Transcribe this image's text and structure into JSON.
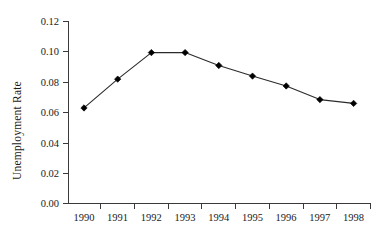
{
  "chart_data": {
    "type": "line",
    "title": "",
    "xlabel": "",
    "ylabel": "Unemployment Rate",
    "categories": [
      "1990",
      "1991",
      "1992",
      "1993",
      "1994",
      "1995",
      "1996",
      "1997",
      "1998"
    ],
    "x": [
      1990,
      1991,
      1992,
      1993,
      1994,
      1995,
      1996,
      1997,
      1998
    ],
    "values": [
      0.063,
      0.082,
      0.0995,
      0.0995,
      0.091,
      0.084,
      0.0775,
      0.0685,
      0.066
    ],
    "series": [
      {
        "name": "Unemployment Rate",
        "values": [
          0.063,
          0.082,
          0.0995,
          0.0995,
          0.091,
          0.084,
          0.0775,
          0.0685,
          0.066
        ]
      }
    ],
    "ylim": [
      0.0,
      0.12
    ],
    "ytick_labels": [
      "0.00",
      "0.02",
      "0.04",
      "0.06",
      "0.08",
      "0.10",
      "0.12"
    ],
    "ytick_values": [
      0.0,
      0.02,
      0.04,
      0.06,
      0.08,
      0.1,
      0.12
    ],
    "xtick_labels": [
      "1990",
      "1991",
      "1992",
      "1993",
      "1994",
      "1995",
      "1996",
      "1997",
      "1998"
    ],
    "grid": false,
    "legend": "none",
    "marker": "diamond",
    "line_color": "#2b2b2b",
    "marker_color": "#000000",
    "background_color": "#ffffff"
  },
  "axes": {
    "y_title": "Unemployment Rate",
    "y_ticks": [
      {
        "label": "0.12"
      },
      {
        "label": "0.10"
      },
      {
        "label": "0.08"
      },
      {
        "label": "0.06"
      },
      {
        "label": "0.04"
      },
      {
        "label": "0.02"
      },
      {
        "label": "0.00"
      }
    ],
    "x_ticks": [
      {
        "label": "1990"
      },
      {
        "label": "1991"
      },
      {
        "label": "1992"
      },
      {
        "label": "1993"
      },
      {
        "label": "1994"
      },
      {
        "label": "1995"
      },
      {
        "label": "1996"
      },
      {
        "label": "1997"
      },
      {
        "label": "1998"
      }
    ]
  }
}
